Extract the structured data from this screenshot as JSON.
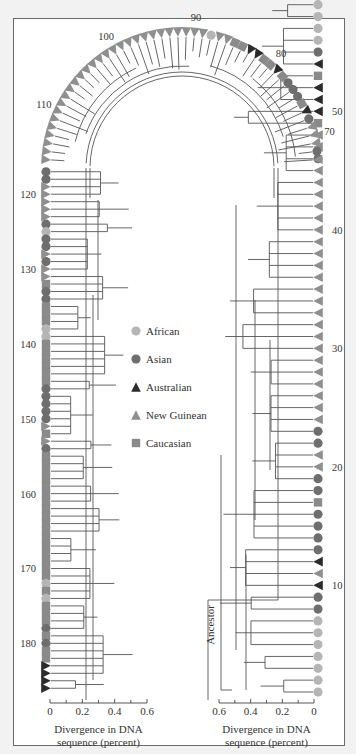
{
  "chart_data": {
    "type": "tree",
    "title": "",
    "legend": [
      {
        "key": "African",
        "label": "African",
        "shape": "circle",
        "color": "#b5b5b5"
      },
      {
        "key": "Asian",
        "label": "Asian",
        "shape": "circle",
        "color": "#6e6e6e"
      },
      {
        "key": "Australian",
        "label": "Australian",
        "shape": "triangle",
        "color": "#2b2b2b"
      },
      {
        "key": "New Guinean",
        "label": "New Guinean",
        "shape": "triangle",
        "color": "#8f8f8f"
      },
      {
        "key": "Caucasian",
        "label": "Caucasian",
        "shape": "square",
        "color": "#8a8a8a"
      }
    ],
    "leaf_count": 182,
    "leaf_number_labels": [
      10,
      20,
      30,
      40,
      50,
      60,
      70,
      80,
      90,
      100,
      110,
      120,
      130,
      140,
      150,
      160,
      170,
      180
    ],
    "root_label": "Ancestor",
    "axes": [
      {
        "side": "left",
        "label_line1": "Divergence in DNA",
        "label_line2": "sequence (percent)",
        "ticks": [
          "0",
          "0.2",
          "0.4",
          "0.6"
        ],
        "range": [
          0,
          0.6
        ]
      },
      {
        "side": "right",
        "label_line1": "Divergence in DNA",
        "label_line2": "sequence (percent)",
        "ticks": [
          "0.6",
          "0.4",
          "0.2",
          "0"
        ],
        "range": [
          0.6,
          0
        ]
      }
    ],
    "leaves_right_bottom_to_top": [
      "African",
      "African",
      "African",
      "African",
      "African",
      "African",
      "African",
      "Asian",
      "Asian",
      "Australian",
      "New Guinean",
      "Australian",
      "Asian",
      "Asian",
      "Asian",
      "Asian",
      "Caucasian",
      "Asian",
      "Asian",
      "New Guinean",
      "New Guinean",
      "Asian",
      "Asian",
      "New Guinean",
      "New Guinean",
      "New Guinean",
      "New Guinean",
      "New Guinean",
      "New Guinean",
      "New Guinean",
      "New Guinean",
      "New Guinean",
      "New Guinean",
      "New Guinean",
      "New Guinean",
      "New Guinean",
      "New Guinean",
      "New Guinean",
      "New Guinean",
      "New Guinean",
      "New Guinean",
      "New Guinean",
      "New Guinean",
      "New Guinean",
      "New Guinean",
      "Asian",
      "New Guinean",
      "New Guinean",
      "Caucasian",
      "Australian",
      "Australian",
      "Australian",
      "Caucasian",
      "Australian",
      "Asian",
      "African",
      "African",
      "African",
      "African",
      "African",
      "Australian",
      "Caucasian",
      "African",
      "African",
      "Caucasian",
      "Asian"
    ],
    "leaves_arc_right_to_left": [
      "New Guinean",
      "Asian",
      "New Guinean",
      "New Guinean",
      "New Guinean",
      "Asian",
      "Australian",
      "Caucasian",
      "Asian",
      "Asian",
      "Asian",
      "Caucasian",
      "Australian",
      "Caucasian",
      "Caucasian",
      "Australian",
      "Australian",
      "Caucasian",
      "Caucasian",
      "New Guinean",
      "New Guinean",
      "African",
      "New Guinean",
      "New Guinean",
      "New Guinean",
      "New Guinean",
      "New Guinean",
      "New Guinean",
      "New Guinean",
      "New Guinean",
      "New Guinean",
      "New Guinean",
      "New Guinean",
      "New Guinean",
      "New Guinean",
      "New Guinean",
      "New Guinean",
      "New Guinean",
      "New Guinean",
      "New Guinean",
      "New Guinean",
      "New Guinean",
      "New Guinean",
      "New Guinean",
      "New Guinean",
      "New Guinean",
      "New Guinean",
      "New Guinean",
      "New Guinean",
      "New Guinean"
    ],
    "leaves_left_top_to_bottom": [
      "Asian",
      "Asian",
      "New Guinean",
      "New Guinean",
      "New Guinean",
      "New Guinean",
      "New Guinean",
      "Asian",
      "African",
      "Asian",
      "Asian",
      "New Guinean",
      "Asian",
      "New Guinean",
      "New Guinean",
      "Caucasian",
      "Asian",
      "Asian",
      "Caucasian",
      "Caucasian",
      "Caucasian",
      "African",
      "African",
      "Caucasian",
      "Caucasian",
      "Caucasian",
      "Caucasian",
      "Caucasian",
      "Caucasian",
      "Asian",
      "Asian",
      "Asian",
      "Asian",
      "Asian",
      "New Guinean",
      "Caucasian",
      "New Guinean",
      "Asian",
      "Caucasian",
      "Caucasian",
      "Caucasian",
      "Caucasian",
      "Caucasian",
      "Caucasian",
      "Caucasian",
      "Caucasian",
      "Caucasian",
      "Caucasian",
      "Caucasian",
      "Caucasian",
      "Caucasian",
      "Caucasian",
      "Caucasian",
      "Caucasian",
      "Caucasian",
      "African",
      "Caucasian",
      "African",
      "Caucasian",
      "Caucasian",
      "Caucasian",
      "Asian",
      "Caucasian",
      "Asian",
      "Caucasian",
      "Caucasian",
      "Australian",
      "Australian",
      "Australian",
      "Australian"
    ]
  },
  "legend_items": [
    "African",
    "Asian",
    "Australian",
    "New Guinean",
    "Caucasian"
  ],
  "left_axis": {
    "line1": "Divergence in DNA",
    "line2": "sequence (percent)"
  },
  "right_axis": {
    "line1": "Divergence in DNA",
    "line2": "sequence (percent)"
  },
  "ancestor_label": "Ancestor"
}
